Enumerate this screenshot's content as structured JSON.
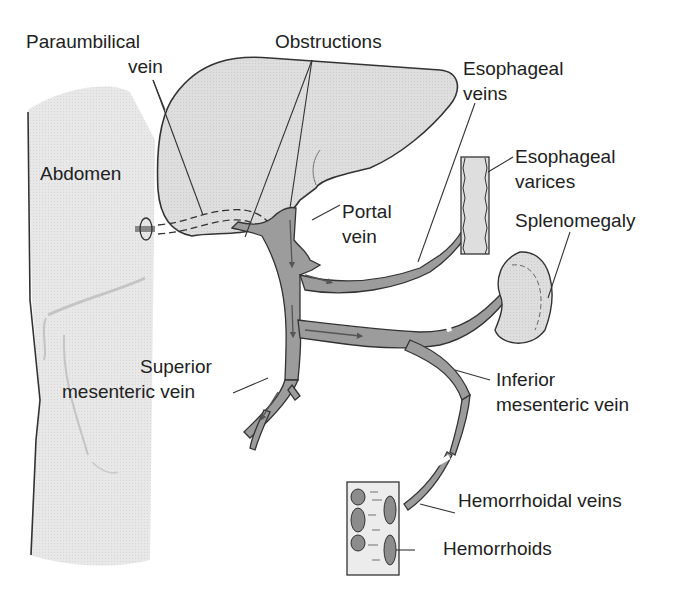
{
  "diagram": {
    "colors": {
      "tissue": "#e6e6e6",
      "liver": "#dcdcdc",
      "vein": "#9a9a9a",
      "outline": "#333333",
      "text": "#222222"
    },
    "labels": {
      "paraumbilical_1": "Paraumbilical",
      "paraumbilical_2": "vein",
      "obstructions": "Obstructions",
      "esophageal_veins_1": "Esophageal",
      "esophageal_veins_2": "veins",
      "abdomen": "Abdomen",
      "esophageal_varices_1": "Esophageal",
      "esophageal_varices_2": "varices",
      "portal_1": "Portal",
      "portal_2": "vein",
      "splenomegaly": "Splenomegaly",
      "superior_1": "Superior",
      "superior_2": "mesenteric vein",
      "inferior_1": "Inferior",
      "inferior_2": "mesenteric vein",
      "hemorrhoidal_veins": "Hemorrhoidal veins",
      "hemorrhoids": "Hemorrhoids"
    },
    "nodes": [
      "Abdomen",
      "Liver",
      "Paraumbilical vein",
      "Obstructions",
      "Portal vein",
      "Esophageal veins",
      "Esophageal varices",
      "Spleen (Splenomegaly)",
      "Superior mesenteric vein",
      "Inferior mesenteric vein",
      "Hemorrhoidal veins",
      "Hemorrhoids"
    ]
  }
}
